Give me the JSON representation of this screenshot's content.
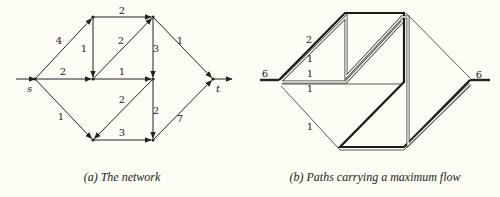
{
  "background": "#fdfcf5",
  "panels": [
    {
      "id": "a",
      "caption": "(a) The network",
      "caption_x": 122,
      "nodes": {
        "s": [
          35,
          79
        ],
        "A": [
          93,
          17
        ],
        "B": [
          93,
          79
        ],
        "C": [
          153,
          17
        ],
        "D": [
          153,
          79
        ],
        "t": [
          213,
          79
        ],
        "E": [
          93,
          140
        ],
        "F": [
          153,
          140
        ]
      },
      "node_labels": [
        {
          "text": "s",
          "x": 27,
          "y": 92
        },
        {
          "text": "t",
          "x": 216,
          "y": 92
        }
      ],
      "source_stub": {
        "from": [
          16,
          79
        ],
        "to": "s"
      },
      "sink_stub": {
        "from": "t",
        "to": [
          232,
          79
        ]
      },
      "edges": [
        {
          "from": "s",
          "to": "A",
          "cap": "4",
          "lx": 59,
          "ly": 44
        },
        {
          "from": "s",
          "to": "B",
          "cap": "2",
          "lx": 63,
          "ly": 75
        },
        {
          "from": "s",
          "to": "E",
          "cap": "1",
          "lx": 61,
          "ly": 120
        },
        {
          "from": "A",
          "to": "C",
          "cap": "2",
          "lx": 122,
          "ly": 14
        },
        {
          "from": "A",
          "to": "B",
          "cap": "1",
          "lx": 84,
          "ly": 52
        },
        {
          "from": "B",
          "to": "C",
          "cap": "2",
          "lx": 121,
          "ly": 44
        },
        {
          "from": "B",
          "to": "D",
          "cap": "1",
          "lx": 122,
          "ly": 75
        },
        {
          "from": "C",
          "to": "D",
          "cap": "3",
          "lx": 156,
          "ly": 52
        },
        {
          "from": "C",
          "to": "t",
          "cap": "1",
          "lx": 180,
          "ly": 44
        },
        {
          "from": "D",
          "to": "E",
          "cap": "2",
          "lx": 122,
          "ly": 103
        },
        {
          "from": "D",
          "to": "F",
          "cap": "2",
          "lx": 156,
          "ly": 114
        },
        {
          "from": "E",
          "to": "F",
          "cap": "3",
          "lx": 122,
          "ly": 136
        },
        {
          "from": "F",
          "to": "t",
          "cap": "7",
          "lx": 180,
          "ly": 122
        }
      ]
    },
    {
      "id": "b",
      "caption": "(b) Paths carrying a maximum flow",
      "caption_x": 375,
      "nodes": {
        "s": [
          279,
          80
        ],
        "A": [
          345,
          13
        ],
        "B": [
          346,
          79
        ],
        "C": [
          404,
          13
        ],
        "D": [
          404,
          82
        ],
        "t": [
          470,
          80
        ],
        "E": [
          340,
          147
        ],
        "F": [
          404,
          147
        ]
      },
      "flow_labels": [
        {
          "text": "6",
          "x": 265,
          "y": 77
        },
        {
          "text": "2",
          "x": 309,
          "y": 43
        },
        {
          "text": "1",
          "x": 310,
          "y": 62
        },
        {
          "text": "1",
          "x": 310,
          "y": 77
        },
        {
          "text": "1",
          "x": 310,
          "y": 92
        },
        {
          "text": "1",
          "x": 310,
          "y": 130
        },
        {
          "text": "6",
          "x": 479,
          "y": 78
        }
      ],
      "source_stub": {
        "from": [
          260,
          80
        ],
        "to": "s",
        "flow": "6"
      },
      "sink_stub": {
        "from": "t",
        "to": [
          490,
          80
        ],
        "flow": "6"
      },
      "paths": [
        {
          "name": "path-heavy-2",
          "style": "thick",
          "points": [
            [
              279,
              80
            ],
            [
              345,
              13
            ],
            [
              404,
              13
            ],
            [
              404,
              82
            ],
            [
              340,
              147
            ],
            [
              404,
              147
            ],
            [
              470,
              80
            ]
          ]
        },
        {
          "name": "path-1a",
          "style": "double",
          "points": [
            [
              282,
              80
            ],
            [
              346,
              17
            ],
            [
              346,
              77
            ],
            [
              402,
              17
            ],
            [
              408,
              17
            ],
            [
              408,
              145
            ],
            [
              470,
              84
            ]
          ]
        },
        {
          "name": "path-1b",
          "style": "double",
          "points": [
            [
              282,
              82
            ],
            [
              346,
              82
            ],
            [
              402,
              22
            ]
          ]
        },
        {
          "name": "path-1c",
          "style": "thin",
          "points": [
            [
              282,
              84
            ],
            [
              402,
              84
            ]
          ]
        },
        {
          "name": "path-1d",
          "style": "thin",
          "points": [
            [
              281,
              86
            ],
            [
              340,
              150
            ],
            [
              404,
              150
            ],
            [
              470,
              86
            ]
          ]
        },
        {
          "name": "path-1e",
          "style": "thin",
          "points": [
            [
              406,
              13
            ],
            [
              470,
              78
            ]
          ]
        }
      ]
    }
  ]
}
